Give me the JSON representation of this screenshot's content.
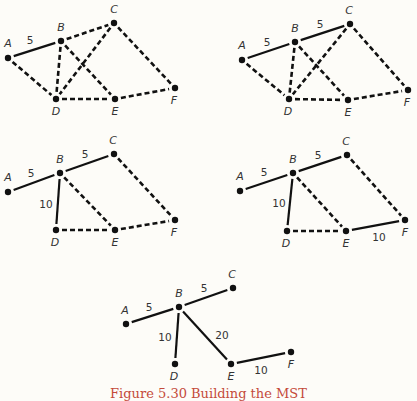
{
  "figure": {
    "caption": "Figure 5.30  Building the MST",
    "colors": {
      "background": "#fdfcf8",
      "ink": "#111111",
      "label": "#333333",
      "caption": "#c44a3a"
    },
    "panels": [
      {
        "id": "step-1",
        "nodes": {
          "A": {
            "x": 8,
            "y": 58,
            "lx": 8,
            "ly": 47
          },
          "B": {
            "x": 61,
            "y": 41,
            "lx": 61,
            "ly": 31
          },
          "C": {
            "x": 114,
            "y": 23,
            "lx": 114,
            "ly": 13
          },
          "D": {
            "x": 56,
            "y": 99,
            "lx": 56,
            "ly": 115
          },
          "E": {
            "x": 115,
            "y": 99,
            "lx": 115,
            "ly": 115
          },
          "F": {
            "x": 175,
            "y": 88,
            "lx": 174,
            "ly": 104
          }
        },
        "edges": [
          {
            "from": "A",
            "to": "B",
            "style": "solid",
            "weight": "5",
            "wx": 30,
            "wy": 44
          },
          {
            "from": "A",
            "to": "D",
            "style": "dashed"
          },
          {
            "from": "B",
            "to": "C",
            "style": "dashed"
          },
          {
            "from": "B",
            "to": "D",
            "style": "dashed"
          },
          {
            "from": "B",
            "to": "E",
            "style": "dashed"
          },
          {
            "from": "C",
            "to": "D",
            "style": "dashed"
          },
          {
            "from": "C",
            "to": "F",
            "style": "dashed"
          },
          {
            "from": "D",
            "to": "E",
            "style": "dashed"
          },
          {
            "from": "E",
            "to": "F",
            "style": "dashed"
          }
        ]
      },
      {
        "id": "step-2",
        "nodes": {
          "A": {
            "x": 242,
            "y": 60,
            "lx": 242,
            "ly": 49
          },
          "B": {
            "x": 295,
            "y": 42,
            "lx": 295,
            "ly": 32
          },
          "C": {
            "x": 350,
            "y": 24,
            "lx": 349,
            "ly": 14
          },
          "D": {
            "x": 289,
            "y": 99,
            "lx": 288,
            "ly": 115
          },
          "E": {
            "x": 348,
            "y": 100,
            "lx": 348,
            "ly": 116
          },
          "F": {
            "x": 408,
            "y": 90,
            "lx": 407,
            "ly": 106
          }
        },
        "edges": [
          {
            "from": "A",
            "to": "B",
            "style": "solid",
            "weight": "5",
            "wx": 267,
            "wy": 46
          },
          {
            "from": "B",
            "to": "C",
            "style": "solid",
            "weight": "5",
            "wx": 320,
            "wy": 28
          },
          {
            "from": "A",
            "to": "D",
            "style": "dashed"
          },
          {
            "from": "B",
            "to": "D",
            "style": "dashed"
          },
          {
            "from": "B",
            "to": "E",
            "style": "dashed"
          },
          {
            "from": "C",
            "to": "D",
            "style": "dashed"
          },
          {
            "from": "C",
            "to": "F",
            "style": "dashed"
          },
          {
            "from": "D",
            "to": "E",
            "style": "dashed"
          },
          {
            "from": "E",
            "to": "F",
            "style": "dashed"
          }
        ]
      },
      {
        "id": "step-3",
        "nodes": {
          "A": {
            "x": 8,
            "y": 192,
            "lx": 8,
            "ly": 181
          },
          "B": {
            "x": 60,
            "y": 173,
            "lx": 60,
            "ly": 163
          },
          "C": {
            "x": 114,
            "y": 154,
            "lx": 113,
            "ly": 144
          },
          "D": {
            "x": 56,
            "y": 230,
            "lx": 55,
            "ly": 246
          },
          "E": {
            "x": 115,
            "y": 230,
            "lx": 115,
            "ly": 246
          },
          "F": {
            "x": 175,
            "y": 220,
            "lx": 174,
            "ly": 236
          }
        },
        "edges": [
          {
            "from": "A",
            "to": "B",
            "style": "solid",
            "weight": "5",
            "wx": 31,
            "wy": 177
          },
          {
            "from": "B",
            "to": "C",
            "style": "solid",
            "weight": "5",
            "wx": 85,
            "wy": 158
          },
          {
            "from": "B",
            "to": "D",
            "style": "solid",
            "weight": "10",
            "wx": 46,
            "wy": 208
          },
          {
            "from": "B",
            "to": "E",
            "style": "dashed"
          },
          {
            "from": "C",
            "to": "F",
            "style": "dashed"
          },
          {
            "from": "D",
            "to": "E",
            "style": "dashed"
          },
          {
            "from": "E",
            "to": "F",
            "style": "dashed"
          }
        ]
      },
      {
        "id": "step-4",
        "nodes": {
          "A": {
            "x": 240,
            "y": 191,
            "lx": 240,
            "ly": 180
          },
          "B": {
            "x": 293,
            "y": 173,
            "lx": 293,
            "ly": 163
          },
          "C": {
            "x": 347,
            "y": 155,
            "lx": 346,
            "ly": 145
          },
          "D": {
            "x": 287,
            "y": 231,
            "lx": 286,
            "ly": 247
          },
          "E": {
            "x": 346,
            "y": 231,
            "lx": 346,
            "ly": 247
          },
          "F": {
            "x": 405,
            "y": 220,
            "lx": 405,
            "ly": 236
          }
        },
        "edges": [
          {
            "from": "A",
            "to": "B",
            "style": "solid",
            "weight": "5",
            "wx": 264,
            "wy": 176
          },
          {
            "from": "B",
            "to": "C",
            "style": "solid",
            "weight": "5",
            "wx": 318,
            "wy": 159
          },
          {
            "from": "B",
            "to": "D",
            "style": "solid",
            "weight": "10",
            "wx": 279,
            "wy": 207
          },
          {
            "from": "E",
            "to": "F",
            "style": "solid",
            "weight": "10",
            "wx": 379,
            "wy": 241
          },
          {
            "from": "B",
            "to": "E",
            "style": "dashed"
          },
          {
            "from": "C",
            "to": "F",
            "style": "dashed"
          },
          {
            "from": "D",
            "to": "E",
            "style": "dashed"
          }
        ]
      },
      {
        "id": "step-5-final-mst",
        "nodes": {
          "A": {
            "x": 126,
            "y": 324,
            "lx": 125,
            "ly": 314
          },
          "B": {
            "x": 179,
            "y": 307,
            "lx": 179,
            "ly": 297
          },
          "C": {
            "x": 233,
            "y": 288,
            "lx": 232,
            "ly": 278
          },
          "D": {
            "x": 175,
            "y": 364,
            "lx": 174,
            "ly": 380
          },
          "E": {
            "x": 231,
            "y": 364,
            "lx": 231,
            "ly": 380
          },
          "F": {
            "x": 291,
            "y": 352,
            "lx": 291,
            "ly": 368
          },
          "_unused": {
            "x": -20,
            "y": -20,
            "lx": -20,
            "ly": -20
          }
        },
        "edges": [
          {
            "from": "A",
            "to": "B",
            "style": "solid",
            "weight": "5",
            "wx": 149,
            "wy": 311
          },
          {
            "from": "B",
            "to": "C",
            "style": "solid",
            "weight": "5",
            "wx": 204,
            "wy": 292
          },
          {
            "from": "B",
            "to": "D",
            "style": "solid",
            "weight": "10",
            "wx": 165,
            "wy": 341
          },
          {
            "from": "B",
            "to": "E",
            "style": "solid",
            "weight": "20",
            "wx": 222,
            "wy": 339
          },
          {
            "from": "E",
            "to": "F",
            "style": "solid",
            "weight": "10",
            "wx": 261,
            "wy": 374
          }
        ]
      }
    ]
  }
}
